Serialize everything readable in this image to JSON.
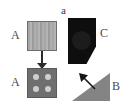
{
  "figure": {
    "panel_label": "a",
    "background_color": "#ffffff"
  },
  "shapes": [
    {
      "id": "a-top",
      "label": "A",
      "kind": "striped-square",
      "description": "light gray square with vertical stripes",
      "fill_color": "#a6a6a6",
      "stroke_color": "#6e6e6e",
      "label_position": "left"
    },
    {
      "id": "a-bottom",
      "label": "A",
      "kind": "dotted-square",
      "description": "dark gray square with four light circular dots in 2x2 grid",
      "fill_color": "#6f6f6f",
      "dot_color": "#cfcfcf",
      "dot_count": 4,
      "label_position": "left"
    },
    {
      "id": "c",
      "label": "C",
      "kind": "dark-pentagon",
      "description": "near-black pentagon with clipped lower-right corner and a faint inner circle",
      "fill_color": "#0e0e0e",
      "blob_color": "#1c1c1c",
      "label_position": "right"
    },
    {
      "id": "b",
      "label": "B",
      "kind": "gray-triangle",
      "description": "medium gray right triangle with hypotenuse from lower-left to upper-right",
      "fill_color": "#848484",
      "label_position": "right"
    }
  ],
  "arrows": [
    {
      "id": "arrow-a-down",
      "direction": "down",
      "from": "a-top",
      "to": "a-bottom",
      "color": "#2b2b2b"
    },
    {
      "id": "arrow-b-diagonal",
      "direction": "up-left",
      "from": "b",
      "to": "c",
      "color": "#1a1a1a"
    }
  ],
  "labels": {
    "panel": "a",
    "a_top": "A",
    "a_bottom": "A",
    "c": "C",
    "b": "B"
  }
}
